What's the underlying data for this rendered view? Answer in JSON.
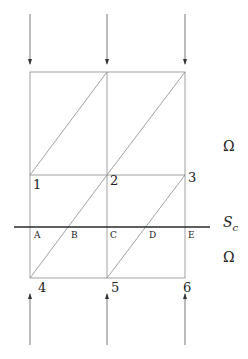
{
  "diagram": {
    "type": "finite element mesh with cut surface",
    "colors": {
      "mesh_line": "#8a8a8a",
      "cut_line": "#2a2a2a",
      "arrow": "#555555",
      "text": "#222222"
    },
    "nodes": [
      {
        "label": "1",
        "x": 30,
        "y": 175
      },
      {
        "label": "2",
        "x": 107,
        "y": 175
      },
      {
        "label": "3",
        "x": 185,
        "y": 175
      },
      {
        "label": "4",
        "x": 30,
        "y": 278
      },
      {
        "label": "5",
        "x": 107,
        "y": 278
      },
      {
        "label": "6",
        "x": 185,
        "y": 278
      }
    ],
    "intersection_points": [
      {
        "label": "A",
        "x": 30,
        "y": 227
      },
      {
        "label": "B",
        "x": 69,
        "y": 227
      },
      {
        "label": "C",
        "x": 107,
        "y": 227
      },
      {
        "label": "D",
        "x": 146,
        "y": 227
      },
      {
        "label": "E",
        "x": 185,
        "y": 227
      }
    ],
    "cut_surface": {
      "label": "S",
      "subscript": "c"
    },
    "regions": [
      {
        "label": "Ω",
        "position": "upper"
      },
      {
        "label": "Ω",
        "position": "lower"
      }
    ],
    "arrows": {
      "top": {
        "direction": "down",
        "count": 3
      },
      "bottom": {
        "direction": "up",
        "count": 3
      }
    }
  }
}
